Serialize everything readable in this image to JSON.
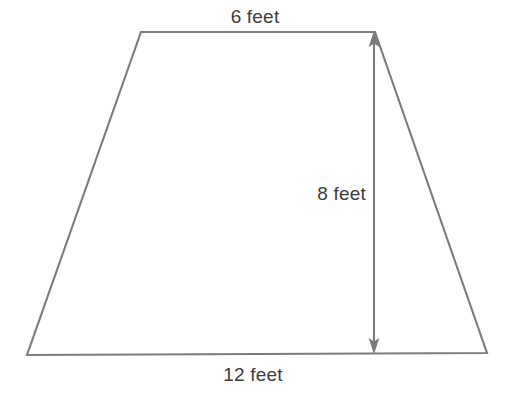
{
  "figure": {
    "shape_name": "trapezoid",
    "stroke_color": "#7b7b7b",
    "text_color": "#3c3c3c",
    "background_color": "#ffffff"
  },
  "labels": {
    "top_side": "6 feet",
    "bottom_side": "12 feet",
    "height": "8 feet"
  },
  "geometry": {
    "top_left": [
      141,
      32
    ],
    "top_right": [
      375,
      32
    ],
    "bottom_right": [
      487,
      353
    ],
    "bottom_left": [
      27,
      355
    ],
    "height_line_x": 374,
    "height_line_top_y": 33,
    "height_line_bottom_y": 353
  },
  "measurements": {
    "top_base_value": 6,
    "bottom_base_value": 12,
    "height_value": 8,
    "units": "feet"
  }
}
